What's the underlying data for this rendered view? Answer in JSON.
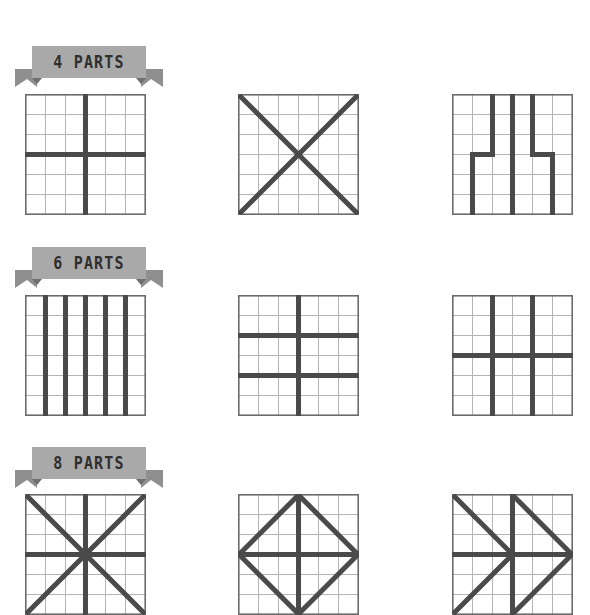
{
  "page": {
    "background_color": "#ffffff",
    "grid_line_color": "#b4b4b4",
    "frame_color": "#6b6b6b",
    "division_line_color": "#4a4a4a",
    "banner_color": "#a9a9a9",
    "banner_text_color": "#2f2f2f",
    "grid_cells": 6
  },
  "sections": [
    {
      "id": "four-parts",
      "banner_label": "4 PARTS",
      "parts": 4,
      "figures": [
        {
          "id": "four-parts-cross",
          "name": "quartered-by-cross",
          "description": "Square divided by one vertical and one horizontal line through the centre into 4 equal squares"
        },
        {
          "id": "four-parts-diagonals",
          "name": "quartered-by-diagonals",
          "description": "Square divided by both diagonals into 4 equal triangles"
        },
        {
          "id": "four-parts-stepped",
          "name": "quartered-by-stepped-verticals",
          "description": "Square divided by three stepped vertical lines into 4 equal interlocking parts"
        }
      ]
    },
    {
      "id": "six-parts",
      "banner_label": "6 PARTS",
      "parts": 6,
      "figures": [
        {
          "id": "six-parts-strips",
          "name": "sixths-vertical-strips",
          "description": "Square divided by five vertical lines into 6 equal vertical strips"
        },
        {
          "id": "six-parts-2x3",
          "name": "sixths-two-by-three",
          "description": "Square divided by one vertical and two horizontal lines into 6 equal rectangles"
        },
        {
          "id": "six-parts-3x2",
          "name": "sixths-three-by-two",
          "description": "Square divided by two vertical and one horizontal line into 6 equal rectangles"
        }
      ]
    },
    {
      "id": "eight-parts",
      "banner_label": "8 PARTS",
      "parts": 8,
      "figures": [
        {
          "id": "eight-parts-star",
          "name": "eighths-eight-spoke-star",
          "description": "Square divided by both diagonals plus vertical and horizontal centre lines into 8 equal triangles"
        },
        {
          "id": "eight-parts-diamond",
          "name": "eighths-inscribed-diamond",
          "description": "Square with inscribed diamond and internal cross dividing it into 8 equal parts"
        },
        {
          "id": "eight-parts-pinwheel",
          "name": "eighths-pinwheel",
          "description": "Square divided by a pinwheel of diagonals and half centre lines into 8 equal parts"
        }
      ]
    }
  ]
}
